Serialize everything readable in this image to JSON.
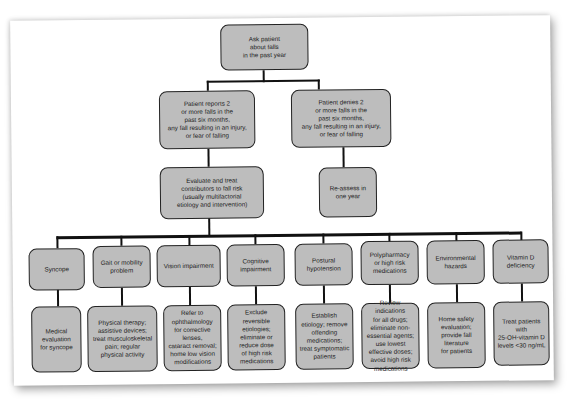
{
  "diagram": {
    "type": "flowchart",
    "root": {
      "id": "ask",
      "label": "Ask patient\nabout falls\nin the past year"
    },
    "level2": [
      {
        "id": "reports",
        "label": "Patient reports 2\nor more falls in the\npast six months,\nany fall resulting in an injury,\nor fear of falling"
      },
      {
        "id": "denies",
        "label": "Patient denies 2\nor more falls in the\npast six months,\nany fall resulting in an injury,\nor fear of falling"
      }
    ],
    "level3": [
      {
        "id": "evaluate",
        "label": "Evaluate and treat\ncontributors to fall risk\n(usually multifactorial\netiology and intervention)"
      },
      {
        "id": "reassess",
        "label": "Re-assess in\none year"
      }
    ],
    "categories": [
      {
        "label": "Syncope",
        "action": "Medical\nevaluation\nfor syncope"
      },
      {
        "label": "Gait or mobility\nproblem",
        "action": "Physical therapy;\nassistive devices;\ntreat musculoskeletal\npain; regular\nphysical activity"
      },
      {
        "label": "Vision impairment",
        "action": "Refer to\nophthalmology\nfor corrective\nlenses,\ncataract removal;\nhome low vision\nmodifications"
      },
      {
        "label": "Cognitive\nimpairment",
        "action": "Exclude\nreversible\netiologies;\neliminate or\nreduce dose\nof high risk\nmedications"
      },
      {
        "label": "Postural\nhypotension",
        "action": "Establish\netiology; remove\noffending\nmedications;\ntreat symptomatic\npatients"
      },
      {
        "label": "Polypharmacy\nor high risk\nmedications",
        "action": "Review indications\nfor all drugs;\neliminate non-\nessential agents;\nuse lowest\neffective doses;\navoid high risk\nmedications"
      },
      {
        "label": "Environmental\nhazards",
        "action": "Home safety\nevaluation;\nprovide fall\nliterature\nfor patients"
      },
      {
        "label": "Vitamin D\ndeficiency",
        "action": "Treat patients\nwith\n25-OH-vitamin D\nlevels <30 ng/mL"
      }
    ],
    "colors": {
      "box_fill": "#bdbdbd",
      "box_border": "#222222",
      "connector": "#111111"
    }
  }
}
